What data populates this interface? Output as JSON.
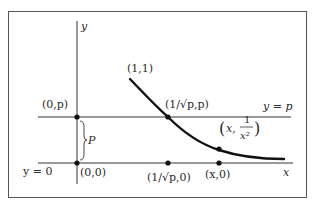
{
  "figure": {
    "colors": {
      "ink": "#2a2a2a",
      "curve": "#111111",
      "background": "#ffffff"
    },
    "axes": {
      "y_label": "y",
      "x_label": "x",
      "y_zero_label": "y = 0"
    },
    "lines": {
      "horizontal_line_label": "y = p",
      "gap_brace_label": "P"
    },
    "curve": {
      "equation": "y = 1/x^2",
      "start_label": "(1,1)"
    },
    "points": [
      {
        "id": "origin",
        "label": "(0,0)"
      },
      {
        "id": "y-intercept-p",
        "label": "(0,p)"
      },
      {
        "id": "intersection",
        "label": "(1/√p,p)"
      },
      {
        "id": "x-proj-intersection",
        "label": "(1/√p,0)"
      },
      {
        "id": "curve-point",
        "label_prefix": "x,",
        "label_num": "1",
        "label_den": "x²"
      },
      {
        "id": "x-proj-curve-point",
        "label": "(x,0)"
      }
    ]
  }
}
